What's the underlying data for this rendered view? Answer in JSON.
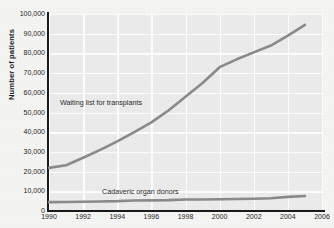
{
  "chart_data": {
    "type": "line",
    "title": "",
    "xlabel": "",
    "ylabel": "Number of patients",
    "xlim": [
      1990,
      2006
    ],
    "ylim": [
      0,
      100000
    ],
    "grid": true,
    "legend_position": "inline-annotations",
    "xticks": [
      "1990",
      "1992",
      "1994",
      "1996",
      "1998",
      "2000",
      "2002",
      "2004",
      "2006"
    ],
    "xtick_values": [
      1990,
      1992,
      1994,
      1996,
      1998,
      2000,
      2002,
      2004,
      2006
    ],
    "yticks": [
      "0",
      "10,000",
      "20,000",
      "30,000",
      "40,000",
      "50,000",
      "60,000",
      "70,000",
      "80,000",
      "90,000",
      "100,000"
    ],
    "ytick_values": [
      0,
      10000,
      20000,
      30000,
      40000,
      50000,
      60000,
      70000,
      80000,
      90000,
      100000
    ],
    "x": [
      1990,
      1991,
      1992,
      1993,
      1994,
      1995,
      1996,
      1997,
      1998,
      1999,
      2000,
      2001,
      2002,
      2003,
      2004,
      2005
    ],
    "series": [
      {
        "name": "Waiting list for transplants",
        "color": "#8a8a8a",
        "values": [
          21900,
          23200,
          27000,
          31000,
          35300,
          40000,
          45000,
          51000,
          58000,
          65000,
          73000,
          77000,
          80500,
          84000,
          89000,
          94500
        ]
      },
      {
        "name": "Cadaveric organ donors",
        "color": "#8a8a8a",
        "values": [
          4500,
          4600,
          4700,
          4850,
          5000,
          5350,
          5400,
          5500,
          5800,
          5850,
          5980,
          6080,
          6190,
          6460,
          7150,
          7600
        ]
      }
    ],
    "annotations": [
      {
        "text": "Waiting list for transplants",
        "series": "Waiting list for transplants"
      },
      {
        "text": "Cadaveric organ donors",
        "series": "Cadaveric organ donors"
      }
    ]
  },
  "colors": {
    "plot_background": "#ebebeb",
    "page_background": "#f4f4f2",
    "gridline": "#fdfdfd",
    "axis": "#1a1a1a",
    "line": "#8a8a8a"
  }
}
